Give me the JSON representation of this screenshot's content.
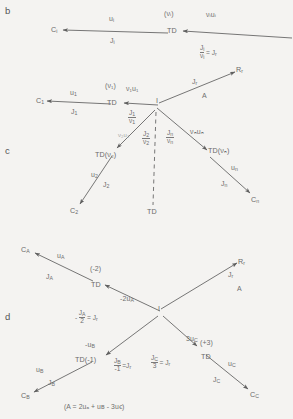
{
  "figure": {
    "panels": [
      {
        "id": "b",
        "label": "b"
      },
      {
        "id": "c",
        "label": "c"
      },
      {
        "id": "d",
        "label": "d"
      }
    ],
    "footnote": "(A = 2uₐ + uʙ - 3uꞓ)"
  },
  "panel_b": {
    "nodes": {
      "ci": {
        "base": "C",
        "sub": "i"
      },
      "td": {
        "text": "TD"
      },
      "td_coef": "(νᵢ)"
    },
    "edges": {
      "ci_above": {
        "base": "u",
        "sub": "i"
      },
      "ci_below": {
        "base": "J",
        "sub": "i"
      },
      "in_above": {
        "text": "νᵢuᵢ"
      },
      "in_below_num": {
        "base": "J",
        "sub": "i"
      },
      "in_below_den": {
        "base": "ν",
        "sub": "i"
      },
      "in_below_eq": {
        "text": "= J"
      },
      "in_below_eq_sub": "r"
    }
  },
  "panel_c": {
    "nodes": {
      "c1": {
        "base": "C",
        "sub": "1"
      },
      "td1": {
        "text": "TD"
      },
      "td1_coef": "(ν₁)",
      "center": {
        "text": "I"
      },
      "rr": {
        "base": "R",
        "sub": "r"
      },
      "td2": {
        "text": "TD(ν₂)"
      },
      "c2": {
        "base": "C",
        "sub": "2"
      },
      "tdn": {
        "text": "TD(νₙ)"
      },
      "cn": {
        "base": "C",
        "sub": "n"
      },
      "td_dashed": {
        "text": "TD"
      }
    },
    "edges": {
      "c1_above": {
        "base": "u",
        "sub": "1"
      },
      "c1_below": {
        "base": "J",
        "sub": "1"
      },
      "e1_above": {
        "text": "ν₁u₁"
      },
      "e1_num": {
        "base": "J",
        "sub": "1"
      },
      "e1_den": {
        "base": "ν",
        "sub": "1"
      },
      "e2_above": {
        "text": "ν₂u₂"
      },
      "e2_num": {
        "base": "J",
        "sub": "2"
      },
      "e2_den": {
        "base": "ν",
        "sub": "2"
      },
      "en_num": {
        "base": "J",
        "sub": "n"
      },
      "en_den": {
        "base": "ν",
        "sub": "n"
      },
      "rr_label": {
        "base": "J",
        "sub": "r"
      },
      "rr_label2": {
        "text": "A"
      },
      "tdn_above": {
        "text": "νₙuₙ"
      },
      "td2_c2_above": {
        "base": "u",
        "sub": "2"
      },
      "td2_c2_below": {
        "base": "J",
        "sub": "2"
      },
      "tdn_cn_above": {
        "base": "u",
        "sub": "n"
      },
      "tdn_cn_below": {
        "base": "J",
        "sub": "n"
      }
    }
  },
  "panel_d": {
    "nodes": {
      "ca": {
        "base": "C",
        "sub": "A"
      },
      "tda": {
        "text": "TD"
      },
      "tda_coef": "(-2)",
      "center": {
        "text": "I"
      },
      "rr": {
        "base": "R",
        "sub": "r"
      },
      "tdb": {
        "text": "TD(-1)"
      },
      "cb": {
        "base": "C",
        "sub": "B"
      },
      "tdc": {
        "text": "TD"
      },
      "tdc_coef": "(+3)",
      "cc": {
        "base": "C",
        "sub": "C"
      }
    },
    "edges": {
      "ca_above": {
        "base": "u",
        "sub": "A"
      },
      "ca_below": {
        "base": "J",
        "sub": "A"
      },
      "a_above": {
        "text": "-2u",
        "sub": "A"
      },
      "a_below_pre": "-",
      "a_below_num": {
        "base": "J",
        "sub": "A"
      },
      "a_below_den": {
        "text": "2"
      },
      "a_below_eq": {
        "text": "= J"
      },
      "a_below_eq_sub": "r",
      "b_above": {
        "text": "-u",
        "sub": "B"
      },
      "b_num": {
        "base": "J",
        "sub": "B"
      },
      "b_den": {
        "text": "-1"
      },
      "b_eq": {
        "text": "=J"
      },
      "b_eq_sub": "r",
      "tdb_cb_above": {
        "base": "u",
        "sub": "B"
      },
      "tdb_cb_below": {
        "base": "J",
        "sub": "B"
      },
      "rr_label": {
        "base": "J",
        "sub": "r"
      },
      "rr_label2": {
        "text": "A"
      },
      "c_above": {
        "text": "3u",
        "sub": "C"
      },
      "c_num": {
        "base": "J",
        "sub": "C"
      },
      "c_den": {
        "text": "3"
      },
      "c_eq": {
        "text": "= J"
      },
      "c_eq_sub": "r",
      "tdc_cc_above": {
        "base": "u",
        "sub": "C"
      },
      "tdc_cc_below": {
        "base": "J",
        "sub": "C"
      }
    }
  },
  "colors": {
    "background": "#f4f3f1",
    "ink": "#6e6e6e",
    "line": "#5f5f5f"
  }
}
